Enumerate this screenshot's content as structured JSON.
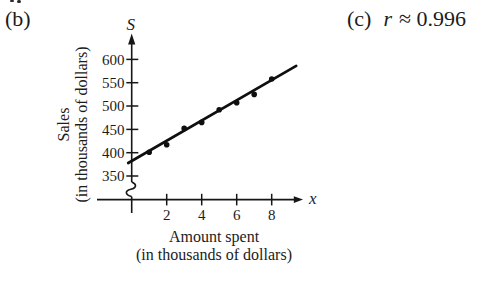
{
  "annotations": {
    "part_b": "(b)",
    "part_c": "(c)",
    "r_symbol": "r",
    "r_value": "≈ 0.996"
  },
  "chart_data": {
    "type": "scatter",
    "x_axis": {
      "symbol": "x",
      "label_line1": "Amount spent",
      "label_line2": "(in thousands of dollars)",
      "ticks": [
        2,
        4,
        6,
        8
      ],
      "range": [
        0,
        9.5
      ]
    },
    "y_axis": {
      "symbol": "S",
      "label_line1": "Sales",
      "label_line2": "(in thousands of dollars)",
      "ticks": [
        350,
        400,
        450,
        500,
        550,
        600
      ],
      "range": [
        350,
        620
      ],
      "axis_break": true
    },
    "points": [
      {
        "x": 1,
        "y": 401
      },
      {
        "x": 2,
        "y": 417
      },
      {
        "x": 3,
        "y": 452
      },
      {
        "x": 4,
        "y": 465
      },
      {
        "x": 5,
        "y": 492
      },
      {
        "x": 6,
        "y": 507
      },
      {
        "x": 7,
        "y": 525
      },
      {
        "x": 8,
        "y": 558
      }
    ],
    "trend_line": {
      "x1": -0.2,
      "y1": 378,
      "x2": 9.4,
      "y2": 586
    },
    "correlation_r": 0.996,
    "grid": false,
    "legend": false
  }
}
